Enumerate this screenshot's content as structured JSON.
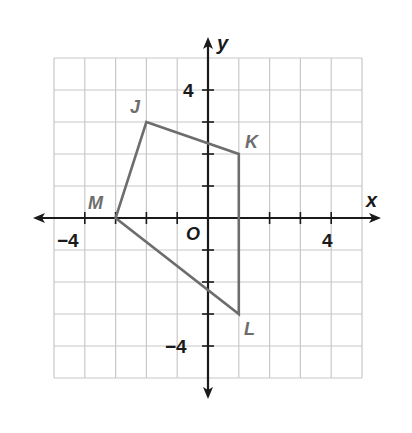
{
  "figure": {
    "type": "coordinate-plane",
    "axes": {
      "x_label": "x",
      "y_label": "y",
      "origin_label": "O",
      "x_range": [
        -5,
        5
      ],
      "y_range": [
        -5,
        5
      ],
      "x_tick_labels": [
        {
          "value": -4,
          "text": "−4"
        },
        {
          "value": 4,
          "text": "4"
        }
      ],
      "y_tick_labels": [
        {
          "value": 4,
          "text": "4"
        },
        {
          "value": -4,
          "text": "−4"
        }
      ]
    },
    "polygon": {
      "name": "JKLM",
      "color": "#6d6d6d",
      "vertices": [
        {
          "label": "J",
          "x": -2,
          "y": 3
        },
        {
          "label": "K",
          "x": 1,
          "y": 2
        },
        {
          "label": "L",
          "x": 1,
          "y": -3
        },
        {
          "label": "M",
          "x": -3,
          "y": 0
        }
      ]
    },
    "colors": {
      "grid": "#c8c8c8",
      "axis": "#1a1a1a",
      "vertex_label": "#6d6d6d",
      "tick_label": "#1a1a1a"
    }
  }
}
